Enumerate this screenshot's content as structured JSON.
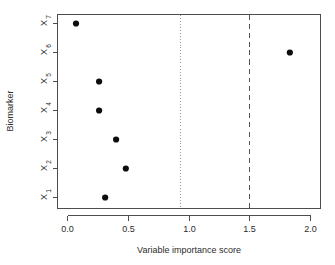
{
  "chart_data": {
    "type": "scatter",
    "title": "",
    "xlabel": "Variable importance score",
    "ylabel": "Biomarker",
    "xlim": [
      -0.08,
      2.09
    ],
    "ylim_categories": [
      "X1",
      "X2",
      "X3",
      "X4",
      "X5",
      "X6",
      "X7"
    ],
    "x_ticks": [
      0.0,
      0.5,
      1.0,
      1.5,
      2.0
    ],
    "x_tick_labels": [
      "0.0",
      "0.5",
      "1.0",
      "1.5",
      "2.0"
    ],
    "y_tick_labels": [
      "X1",
      "X2",
      "X3",
      "X4",
      "X5",
      "X6",
      "X7"
    ],
    "y_tick_label_parts": [
      {
        "base": "X",
        "sub": "1"
      },
      {
        "base": "X",
        "sub": "2"
      },
      {
        "base": "X",
        "sub": "3"
      },
      {
        "base": "X",
        "sub": "4"
      },
      {
        "base": "X",
        "sub": "5"
      },
      {
        "base": "X",
        "sub": "6"
      },
      {
        "base": "X",
        "sub": "7"
      }
    ],
    "grid": false,
    "legend": false,
    "categories": [
      "X1",
      "X2",
      "X3",
      "X4",
      "X5",
      "X6",
      "X7"
    ],
    "values": [
      0.31,
      0.48,
      0.4,
      0.26,
      0.26,
      1.83,
      0.07
    ],
    "points": [
      {
        "label": "X7",
        "value": 0.07,
        "row": 7
      },
      {
        "label": "X6",
        "value": 1.83,
        "row": 6
      },
      {
        "label": "X5",
        "value": 0.26,
        "row": 5
      },
      {
        "label": "X4",
        "value": 0.26,
        "row": 4
      },
      {
        "label": "X3",
        "value": 0.4,
        "row": 3
      },
      {
        "label": "X2",
        "value": 0.48,
        "row": 2
      },
      {
        "label": "X1",
        "value": 0.31,
        "row": 1
      }
    ],
    "reference_lines": [
      {
        "name": "dotted-threshold",
        "value": 0.93,
        "style": "dotted",
        "color": "#9a9a9a"
      },
      {
        "name": "dashed-threshold",
        "value": 1.5,
        "style": "dashed",
        "color": "#555555"
      }
    ],
    "point_color": "#0d0d0d",
    "axis_color": "#4d4d4d"
  }
}
